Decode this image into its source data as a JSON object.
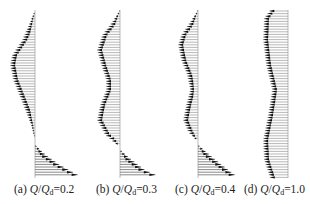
{
  "chart_data": [
    {
      "type": "vector-profile",
      "panel": "a",
      "label_prefix": "(a)",
      "ratio_label": "Q/Qd",
      "ratio_value": "0.2",
      "axis_x": 35,
      "top_y": 10,
      "bottom_y": 178,
      "upper_profile_left": [
        [
          10,
          35
        ],
        [
          22,
          30
        ],
        [
          40,
          22
        ],
        [
          55,
          12
        ],
        [
          65,
          10
        ],
        [
          80,
          13
        ],
        [
          95,
          19
        ],
        [
          110,
          25
        ],
        [
          125,
          31
        ],
        [
          140,
          35
        ]
      ],
      "lower_profile_right": [
        [
          145,
          35
        ],
        [
          155,
          46
        ],
        [
          165,
          60
        ],
        [
          175,
          78
        ]
      ]
    },
    {
      "type": "vector-profile",
      "panel": "b",
      "label_prefix": "(b)",
      "ratio_label": "Q/Qd",
      "ratio_value": "0.3",
      "axis_x": 120,
      "top_y": 10,
      "bottom_y": 178,
      "upper_profile_left": [
        [
          10,
          120
        ],
        [
          22,
          112
        ],
        [
          35,
          102
        ],
        [
          50,
          97
        ],
        [
          65,
          101
        ],
        [
          80,
          106
        ],
        [
          90,
          106
        ],
        [
          105,
          100
        ],
        [
          120,
          97
        ],
        [
          135,
          105
        ],
        [
          145,
          117
        ]
      ],
      "lower_profile_right": [
        [
          150,
          120
        ],
        [
          160,
          132
        ],
        [
          170,
          145
        ],
        [
          176,
          158
        ]
      ]
    },
    {
      "type": "vector-profile",
      "panel": "c",
      "label_prefix": "(c)",
      "ratio_label": "Q/Qd",
      "ratio_value": "0.4",
      "axis_x": 198,
      "top_y": 10,
      "bottom_y": 178,
      "upper_profile_left": [
        [
          10,
          198
        ],
        [
          22,
          190
        ],
        [
          35,
          181
        ],
        [
          45,
          178
        ],
        [
          60,
          181
        ],
        [
          75,
          187
        ],
        [
          90,
          190
        ],
        [
          105,
          186
        ],
        [
          120,
          183
        ],
        [
          132,
          188
        ],
        [
          140,
          196
        ]
      ],
      "lower_profile_right": [
        [
          145,
          198
        ],
        [
          155,
          210
        ],
        [
          165,
          222
        ],
        [
          175,
          235
        ]
      ]
    },
    {
      "type": "vector-profile",
      "panel": "d",
      "label_prefix": "(d)",
      "ratio_label": "Q/Qd",
      "ratio_value": "1.0",
      "axis_x": 288,
      "top_y": 10,
      "bottom_y": 178,
      "upper_profile_left": [
        [
          10,
          270
        ],
        [
          18,
          264
        ],
        [
          40,
          263
        ],
        [
          65,
          266
        ],
        [
          90,
          272
        ],
        [
          115,
          268
        ],
        [
          140,
          263
        ],
        [
          160,
          264
        ],
        [
          178,
          270
        ]
      ],
      "lower_profile_right": []
    }
  ],
  "captions": [
    {
      "prefix": "(a) ",
      "q": "Q",
      "slash": "/",
      "qd": "Q",
      "sub": "d",
      "eq": "=0.2"
    },
    {
      "prefix": "(b) ",
      "q": "Q",
      "slash": "/",
      "qd": "Q",
      "sub": "d",
      "eq": "=0.3"
    },
    {
      "prefix": "(c) ",
      "q": "Q",
      "slash": "/",
      "qd": "Q",
      "sub": "d",
      "eq": "=0.4"
    },
    {
      "prefix": "(d) ",
      "q": "Q",
      "slash": "/",
      "qd": "Q",
      "sub": "d",
      "eq": "=1.0"
    }
  ]
}
